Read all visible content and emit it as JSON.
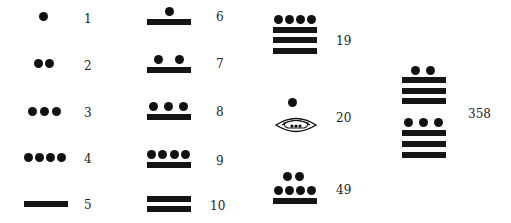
{
  "colors": {
    "glyph": "#111111",
    "label": "#222222",
    "background": "#ffffff"
  },
  "numerals": [
    {
      "value": 1,
      "label": "1",
      "composition": {
        "dots": 1,
        "bars": 0
      }
    },
    {
      "value": 2,
      "label": "2",
      "composition": {
        "dots": 2,
        "bars": 0
      }
    },
    {
      "value": 3,
      "label": "3",
      "composition": {
        "dots": 3,
        "bars": 0
      }
    },
    {
      "value": 4,
      "label": "4",
      "composition": {
        "dots": 4,
        "bars": 0
      }
    },
    {
      "value": 5,
      "label": "5",
      "composition": {
        "dots": 0,
        "bars": 1
      }
    },
    {
      "value": 6,
      "label": "6",
      "composition": {
        "dots": 1,
        "bars": 1
      }
    },
    {
      "value": 7,
      "label": "7",
      "composition": {
        "dots": 2,
        "bars": 1
      }
    },
    {
      "value": 8,
      "label": "8",
      "composition": {
        "dots": 3,
        "bars": 1
      }
    },
    {
      "value": 9,
      "label": "9",
      "composition": {
        "dots": 4,
        "bars": 1
      }
    },
    {
      "value": 10,
      "label": "10",
      "composition": {
        "dots": 0,
        "bars": 2
      }
    },
    {
      "value": 19,
      "label": "19",
      "composition": {
        "dots": 4,
        "bars": 3
      }
    },
    {
      "value": 20,
      "label": "20",
      "composition": {
        "upper": {
          "dots": 1,
          "bars": 0
        },
        "lower": "shell-zero"
      }
    },
    {
      "value": 49,
      "label": "49",
      "composition": {
        "upper": {
          "dots": 2,
          "bars": 0
        },
        "lower": {
          "dots": 4,
          "bars": 1
        }
      }
    },
    {
      "value": 358,
      "label": "358",
      "composition": {
        "upper": {
          "dots": 2,
          "bars": 3
        },
        "lower": {
          "dots": 3,
          "bars": 3
        }
      }
    }
  ],
  "icons": {
    "zero": "shell-icon",
    "one": "dot-icon",
    "five": "bar-icon"
  }
}
